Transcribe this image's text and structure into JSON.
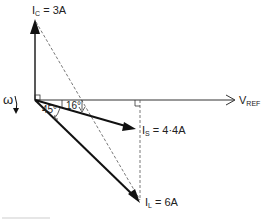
{
  "diagram": {
    "type": "phasor-diagram",
    "rotation_symbol": "ω",
    "reference": {
      "name": "V",
      "subscript": "REF"
    },
    "phasors": [
      {
        "name": "I",
        "subscript": "C",
        "value": "3A",
        "label_suffix": " = 3A",
        "direction": "up (90° leading)"
      },
      {
        "name": "I",
        "subscript": "S",
        "value": "4·4A",
        "label_suffix": " = 4·4A",
        "angle_deg": -16
      },
      {
        "name": "I",
        "subscript": "L",
        "value": "6A",
        "label_suffix": " = 6A",
        "angle_deg": -45
      }
    ],
    "angles": {
      "load_angle": "45°",
      "supply_angle": "16°"
    }
  }
}
